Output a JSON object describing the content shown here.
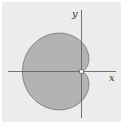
{
  "figure": {
    "type": "polar-curve",
    "curve": "cardioid",
    "equation": "r = a(1 - cos θ)",
    "axes": {
      "x_label": "x",
      "y_label": "y"
    },
    "origin_marker": "open-circle",
    "colors": {
      "background": "#ececec",
      "fill": "#b3b3b3",
      "outline": "#7a7a7a",
      "axis": "#555555"
    }
  }
}
